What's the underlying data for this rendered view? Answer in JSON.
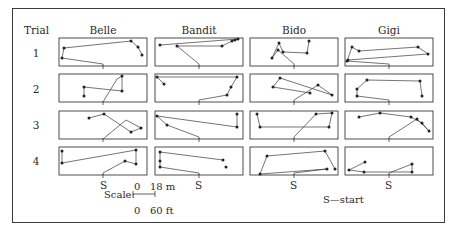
{
  "figure": {
    "row_header": "Trial",
    "columns": [
      "Belle",
      "Bandit",
      "Bido",
      "Gigi"
    ],
    "rows": [
      "1",
      "2",
      "3",
      "4"
    ],
    "start_marker_label": "S",
    "legend": "S—start",
    "scale": {
      "label": "Scale:",
      "top": "0   18 m",
      "bottom": "0   60 ft"
    }
  },
  "chart_data": {
    "type": "diagram",
    "panels": {
      "Belle": {
        "1": [
          [
            44,
            28
          ],
          [
            44,
            26
          ],
          [
            3,
            20
          ],
          [
            5,
            10
          ],
          [
            72,
            3
          ],
          [
            79,
            9
          ],
          [
            83,
            17
          ]
        ],
        "2": [
          [
            44,
            28
          ],
          [
            58,
            5
          ],
          [
            63,
            2
          ],
          [
            63,
            17
          ],
          [
            25,
            13
          ],
          [
            25,
            22
          ]
        ],
        "3": [
          [
            44,
            28
          ],
          [
            67,
            9
          ],
          [
            82,
            17
          ],
          [
            72,
            21
          ],
          [
            45,
            3
          ],
          [
            30,
            7
          ]
        ],
        "4": [
          [
            44,
            28
          ],
          [
            44,
            26
          ],
          [
            66,
            14
          ],
          [
            77,
            17
          ],
          [
            77,
            3
          ],
          [
            3,
            16
          ],
          [
            3,
            4
          ]
        ]
      },
      "Bandit": {
        "1": [
          [
            44,
            28
          ],
          [
            44,
            26
          ],
          [
            22,
            8
          ],
          [
            67,
            8
          ],
          [
            77,
            3
          ],
          [
            80,
            2
          ],
          [
            83,
            1
          ],
          [
            5,
            7
          ]
        ],
        "2": [
          [
            44,
            28
          ],
          [
            44,
            26
          ],
          [
            72,
            21
          ],
          [
            76,
            13
          ],
          [
            82,
            3
          ],
          [
            2,
            3
          ],
          [
            9,
            10
          ]
        ],
        "3": [
          [
            44,
            28
          ],
          [
            44,
            26
          ],
          [
            12,
            14
          ],
          [
            2,
            5
          ],
          [
            82,
            16
          ],
          [
            82,
            3
          ]
        ],
        "4": [
          [
            44,
            28
          ],
          [
            44,
            26
          ],
          [
            5,
            20
          ],
          [
            5,
            14
          ],
          [
            5,
            5
          ],
          [
            68,
            13
          ]
        ],
        "4_extra_dot": [
          [
            71,
            20
          ]
        ]
      },
      "Bido": {
        "1": [
          [
            44,
            28
          ],
          [
            44,
            26
          ],
          [
            28,
            12
          ],
          [
            22,
            20
          ],
          [
            29,
            5
          ],
          [
            33,
            14
          ],
          [
            57,
            15
          ],
          [
            59,
            3
          ]
        ],
        "2": [
          [
            44,
            28
          ],
          [
            44,
            26
          ],
          [
            68,
            11
          ],
          [
            82,
            21
          ],
          [
            30,
            4
          ],
          [
            23,
            13
          ],
          [
            60,
            19
          ]
        ],
        "3": [
          [
            44,
            28
          ],
          [
            44,
            26
          ],
          [
            66,
            3
          ],
          [
            82,
            2
          ],
          [
            79,
            16
          ],
          [
            10,
            16
          ],
          [
            7,
            3
          ]
        ],
        "4": [
          [
            44,
            28
          ],
          [
            44,
            26
          ],
          [
            77,
            22
          ],
          [
            10,
            27
          ],
          [
            17,
            9
          ],
          [
            75,
            4
          ],
          [
            85,
            22
          ]
        ]
      },
      "Gigi": {
        "1": [
          [
            44,
            28
          ],
          [
            44,
            26
          ],
          [
            2,
            23
          ],
          [
            7,
            9
          ],
          [
            14,
            13
          ],
          [
            73,
            9
          ],
          [
            83,
            16
          ],
          [
            3,
            22
          ]
        ],
        "2": [
          [
            44,
            28
          ],
          [
            44,
            26
          ],
          [
            12,
            22
          ],
          [
            12,
            15
          ],
          [
            22,
            6
          ],
          [
            75,
            7
          ],
          [
            77,
            22
          ]
        ],
        "3": [
          [
            44,
            28
          ],
          [
            44,
            26
          ],
          [
            72,
            8
          ],
          [
            84,
            20
          ],
          [
            77,
            12
          ],
          [
            66,
            6
          ],
          [
            35,
            2
          ],
          [
            14,
            6
          ]
        ],
        "4": [
          [
            44,
            28
          ],
          [
            44,
            26
          ],
          [
            67,
            17
          ],
          [
            67,
            25
          ],
          [
            19,
            25
          ],
          [
            4,
            23
          ],
          [
            20,
            15
          ]
        ]
      }
    },
    "scale": {
      "metric": "0-18 m",
      "imperial": "0-60 ft"
    },
    "legend": "S = start"
  }
}
